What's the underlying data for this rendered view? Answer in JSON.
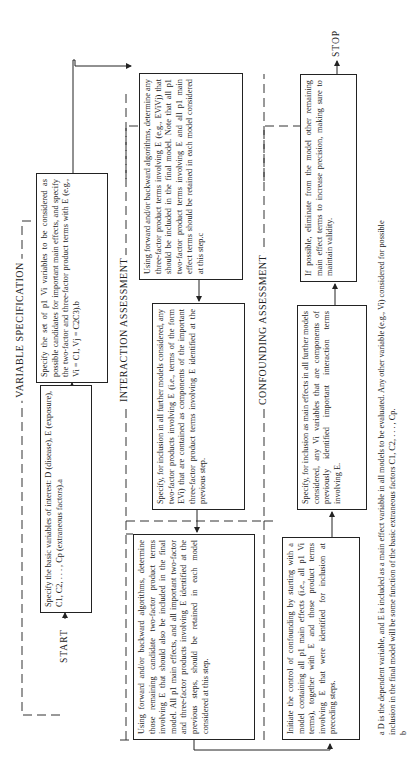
{
  "flowchart": {
    "start_label": "START",
    "stop_label": "STOP",
    "sections": [
      {
        "id": "variable-specification",
        "label": "VARIABLE SPECIFICATION"
      },
      {
        "id": "interaction-assessment",
        "label": "INTERACTION ASSESSMENT"
      },
      {
        "id": "confounding-assessment",
        "label": "CONFOUNDING ASSESSMENT"
      }
    ],
    "steps": {
      "basic_variables": "Specify the basic variables of interest: D (disease), E (exposure), C1, C2, . . . , Cp (extraneous factors).a",
      "candidate_variables": "Specify the set of p1 Vi variables to be considered as possible candidates for important main effects, and specify the two-factor and three-factor product terms with E (e.g., Vi = C1, Vj = C2C3).b",
      "three_factor_selection": "Using forward and/or backward algorithms, determine any three-factor product terms involving E (e.g., EViVj) that should be included in the final model. Note that all p1 two-factor product terms involving E and all p1 main effect terms should be retained in each model considered at this step.c",
      "two_factor_inclusion": "Specify, for inclusion in all further models considered, any two-factor products involving E (i.e., terms of the form EVi) that are contained as components of the important three-factor product terms involving E identified at the previous step.",
      "two_factor_selection": "Using forward and/or backward algorithms, determine those remaining candidate two-factor product terms involving E that should also be included in the final model. All p1 main effects, and all important two-factor and three-factor products involving E identified at the previous steps, should be retained in each model considered at this step.",
      "confounding_initiate": "Initiate the control of confounding by starting with a model containing all p1 main effects (i.e., all p1 Vi terms), together with E and those product terms involving E that were identified for inclusion at preceding steps.",
      "main_effects_inclusion": "Specify, for inclusion as main effects in all further models considered, any Vi variables that are components of previously identified important interaction terms involving E.",
      "eliminate_terms": "If possible, eliminate from the model other remaining main effect terms to increase precision, making sure to maintain validity."
    },
    "footnotes": [
      "a D is the dependent variable, and E is included as a main effect variable in all models to be evaluated. Any other variable (e.g., Vi) considered for possible",
      "inclusion in the final model will be some function of the basic extraneous factors C1, C2, . . . , Cp.",
      "b"
    ]
  }
}
